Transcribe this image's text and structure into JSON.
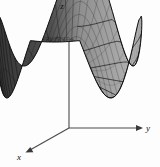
{
  "figure": {
    "title": "",
    "background_color": "#fdfdfd",
    "width": 160,
    "height": 167
  },
  "axes": {
    "x": {
      "label": "x",
      "arrow": "down-left",
      "label_x": 19,
      "label_y": 157
    },
    "y": {
      "label": "y",
      "arrow": "right",
      "label_x": 148,
      "label_y": 131
    },
    "z": {
      "label": "z",
      "arrow": "up",
      "label_x": 62,
      "label_y": 9
    },
    "origin": {
      "x": 69,
      "y": 128
    },
    "color": "#4a4a4a"
  },
  "surface": {
    "mesh_color_dark": "#1a1a1a",
    "mesh_color_light": "#3a3a3a",
    "fill_left": "#3b3b3b",
    "fill_right": "#9a9a9a",
    "fill_rim": "#6e6e6e",
    "contour_color": "#141414",
    "shading": "left-dark-right-light"
  },
  "chart_data": {
    "type": "surface",
    "title": "",
    "xlabel": "x",
    "ylabel": "y",
    "zlabel": "z",
    "function": "double-well potential surface with two minima separated by a saddle",
    "xlim": [
      -1.6,
      1.6
    ],
    "ylim": [
      -1.6,
      1.6
    ],
    "zlim": [
      0,
      1
    ],
    "grid": false,
    "legend": false,
    "minima": [
      {
        "x": -1.0,
        "y": 0.0,
        "z": 0.0
      },
      {
        "x": 1.0,
        "y": 0.0,
        "z": 0.0
      }
    ],
    "saddle": {
      "x": 0.0,
      "y": 0.0,
      "z": 0.34
    },
    "mesh_u_lines": 48,
    "mesh_v_lines": 12,
    "contour_levels": [
      0.08,
      0.18,
      0.3,
      0.45,
      0.62,
      0.8
    ]
  }
}
